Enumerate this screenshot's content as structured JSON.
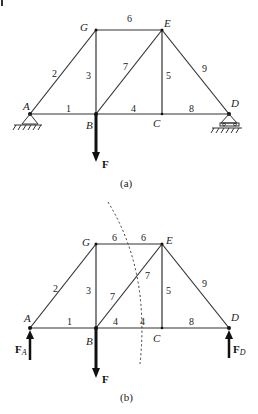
{
  "figure": {
    "diagram_a": {
      "caption": "(a)",
      "joints": {
        "A": "A",
        "B": "B",
        "C": "C",
        "D": "D",
        "E": "E",
        "G": "G"
      },
      "members": {
        "m1": "1",
        "m2": "2",
        "m3": "3",
        "m4": "4",
        "m5": "5",
        "m6": "6",
        "m7": "7",
        "m8": "8",
        "m9": "9"
      },
      "load": "F"
    },
    "diagram_b": {
      "caption": "(b)",
      "joints": {
        "A": "A",
        "B": "B",
        "C": "C",
        "D": "D",
        "E": "E",
        "G": "G"
      },
      "members": {
        "m1": "1",
        "m2": "2",
        "m3": "3",
        "m4a": "4",
        "m4b": "4",
        "m5": "5",
        "m6a": "6",
        "m6b": "6",
        "m7a": "7",
        "m7b": "7",
        "m8": "8",
        "m9": "9"
      },
      "load": "F",
      "reaction_A": {
        "main": "F",
        "sub": "A"
      },
      "reaction_D": {
        "main": "F",
        "sub": "D"
      }
    }
  }
}
